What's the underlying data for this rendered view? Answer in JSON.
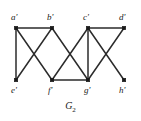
{
  "figure": {
    "caption_base": "G",
    "caption_sub": "2",
    "caption_full": "G2"
  },
  "chart_data": {
    "type": "diagram",
    "subtype": "undirected-graph",
    "title": "G2",
    "xlabel": "",
    "ylabel": "",
    "grid": false,
    "legend": "none",
    "nodes": [
      {
        "id": "a'",
        "label": "a'",
        "x": 16,
        "y": 28,
        "row": "top",
        "label_x": 11,
        "label_y": 13
      },
      {
        "id": "b'",
        "label": "b'",
        "x": 52,
        "y": 28,
        "row": "top",
        "label_x": 47,
        "label_y": 13
      },
      {
        "id": "c'",
        "label": "c'",
        "x": 88,
        "y": 28,
        "row": "top",
        "label_x": 83,
        "label_y": 13
      },
      {
        "id": "d'",
        "label": "d'",
        "x": 124,
        "y": 28,
        "row": "top",
        "label_x": 119,
        "label_y": 13
      },
      {
        "id": "e'",
        "label": "e'",
        "x": 16,
        "y": 80,
        "row": "bottom",
        "label_x": 11,
        "label_y": 86
      },
      {
        "id": "f'",
        "label": "f'",
        "x": 52,
        "y": 80,
        "row": "bottom",
        "label_x": 48,
        "label_y": 86
      },
      {
        "id": "g'",
        "label": "g'",
        "x": 88,
        "y": 80,
        "row": "bottom",
        "label_x": 84,
        "label_y": 86
      },
      {
        "id": "h'",
        "label": "h'",
        "x": 124,
        "y": 80,
        "row": "bottom",
        "label_x": 119,
        "label_y": 86
      }
    ],
    "edges": [
      {
        "from": "a'",
        "to": "b'",
        "x1": 16,
        "y1": 28,
        "x2": 52,
        "y2": 28
      },
      {
        "from": "c'",
        "to": "d'",
        "x1": 88,
        "y1": 28,
        "x2": 124,
        "y2": 28
      },
      {
        "from": "a'",
        "to": "e'",
        "x1": 16,
        "y1": 28,
        "x2": 16,
        "y2": 80
      },
      {
        "from": "a'",
        "to": "f'",
        "x1": 16,
        "y1": 28,
        "x2": 52,
        "y2": 80
      },
      {
        "from": "b'",
        "to": "e'",
        "x1": 52,
        "y1": 28,
        "x2": 16,
        "y2": 80
      },
      {
        "from": "b'",
        "to": "g'",
        "x1": 52,
        "y1": 28,
        "x2": 88,
        "y2": 80
      },
      {
        "from": "c'",
        "to": "f'",
        "x1": 88,
        "y1": 28,
        "x2": 52,
        "y2": 80
      },
      {
        "from": "c'",
        "to": "g'",
        "x1": 88,
        "y1": 28,
        "x2": 88,
        "y2": 80
      },
      {
        "from": "c'",
        "to": "h'",
        "x1": 88,
        "y1": 28,
        "x2": 124,
        "y2": 80
      },
      {
        "from": "d'",
        "to": "g'",
        "x1": 124,
        "y1": 28,
        "x2": 88,
        "y2": 80
      },
      {
        "from": "f'",
        "to": "g'",
        "x1": 52,
        "y1": 80,
        "x2": 88,
        "y2": 80
      }
    ],
    "colors": {
      "edge": "#2b2b2b",
      "vertex": "#1a1a1a",
      "background": "#ffffff",
      "text": "#1a1a1a"
    },
    "vertex_marker": {
      "shape": "square",
      "size": 3.4
    }
  }
}
